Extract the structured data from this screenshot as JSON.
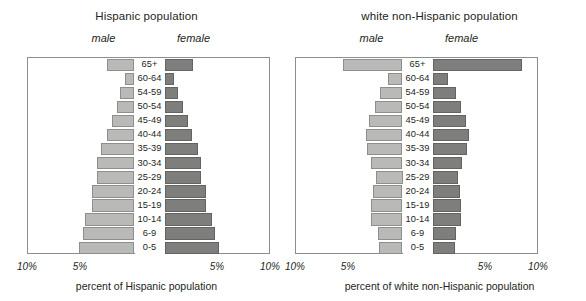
{
  "panels": [
    {
      "id": "hispanic",
      "title": "Hispanic population",
      "male_label": "male",
      "female_label": "female",
      "axis_caption": "percent of Hispanic population",
      "tick_outer_left": "10%",
      "tick_inner_left": "5%",
      "tick_inner_right": "5%",
      "tick_outer_right": "10%"
    },
    {
      "id": "white-non-hispanic",
      "title": "white non-Hispanic population",
      "male_label": "male",
      "female_label": "female",
      "axis_caption": "percent of white non-Hispanic population",
      "tick_outer_left": "10%",
      "tick_inner_left": "5%",
      "tick_inner_right": "5%",
      "tick_outer_right": "10%"
    }
  ],
  "age_groups": [
    "65+",
    "60-64",
    "54-59",
    "50-54",
    "45-49",
    "40-44",
    "35-39",
    "30-34",
    "25-29",
    "20-24",
    "15-19",
    "10-14",
    "6-9",
    "0-5"
  ],
  "colors": {
    "male_fill": "#b9b9b7",
    "male_stroke": "#8e8e8c",
    "female_fill": "#7e7e7c",
    "female_stroke": "#636361",
    "axis": "#8d8d8d",
    "text": "#231f20"
  },
  "chart_data": [
    {
      "type": "bar",
      "subtype": "population-pyramid",
      "title": "Hispanic population",
      "xlabel": "percent of Hispanic population",
      "ylabel": "",
      "categories": [
        "65+",
        "60-64",
        "54-59",
        "50-54",
        "45-49",
        "40-44",
        "35-39",
        "30-34",
        "25-29",
        "20-24",
        "15-19",
        "10-14",
        "6-9",
        "0-5"
      ],
      "xticks": [
        "10%",
        "5%",
        "5%",
        "10%"
      ],
      "xlim": [
        0,
        10
      ],
      "grid": false,
      "legend_position": "above-axis",
      "series": [
        {
          "name": "male",
          "side": "left",
          "values": [
            2.6,
            0.85,
            1.35,
            1.6,
            2.1,
            2.6,
            3.1,
            3.5,
            3.5,
            4.0,
            4.0,
            4.6,
            4.8,
            5.2
          ]
        },
        {
          "name": "female",
          "side": "right",
          "values": [
            2.7,
            0.85,
            1.3,
            1.75,
            2.15,
            2.6,
            3.1,
            3.4,
            3.45,
            3.9,
            3.9,
            4.4,
            4.7,
            5.1
          ]
        }
      ]
    },
    {
      "type": "bar",
      "subtype": "population-pyramid",
      "title": "white non-Hispanic population",
      "xlabel": "percent of white non-Hispanic population",
      "ylabel": "",
      "categories": [
        "65+",
        "60-64",
        "54-59",
        "50-54",
        "45-49",
        "40-44",
        "35-39",
        "30-34",
        "25-29",
        "20-24",
        "15-19",
        "10-14",
        "6-9",
        "0-5"
      ],
      "xticks": [
        "10%",
        "5%",
        "5%",
        "10%"
      ],
      "xlim": [
        0,
        10
      ],
      "grid": false,
      "legend_position": "above-axis",
      "series": [
        {
          "name": "male",
          "side": "left",
          "values": [
            5.6,
            1.35,
            2.1,
            2.6,
            3.1,
            3.4,
            3.3,
            2.9,
            2.5,
            2.8,
            2.9,
            2.9,
            2.3,
            2.2
          ]
        },
        {
          "name": "female",
          "side": "right",
          "values": [
            8.4,
            1.45,
            2.2,
            2.7,
            3.1,
            3.4,
            3.2,
            2.8,
            2.4,
            2.6,
            2.7,
            2.7,
            2.2,
            2.1
          ]
        }
      ]
    }
  ]
}
